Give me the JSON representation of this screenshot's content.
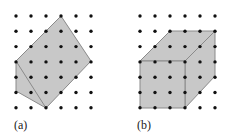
{
  "figure": {
    "panels": [
      {
        "id": "a",
        "label": "(a)",
        "grid": {
          "cols": 6,
          "rows": 7,
          "x0": 16,
          "y0": 16,
          "dx": 15,
          "dy": 15.3
        },
        "shape": "irregular pentagon polygon on dot lattice with internal diagonal edge",
        "polygon": [
          [
            61,
            16
          ],
          [
            91,
            61
          ],
          [
            46,
            108
          ],
          [
            16,
            91
          ],
          [
            16,
            61
          ]
        ],
        "inner_edge": [
          [
            16,
            61
          ],
          [
            46,
            108
          ]
        ]
      },
      {
        "id": "b",
        "label": "(b)",
        "grid": {
          "cols": 6,
          "rows": 7,
          "x0": 140,
          "y0": 16,
          "dx": 15,
          "dy": 15.3
        },
        "shape": "cube drawn on dot lattice",
        "front_face": [
          [
            140,
            61
          ],
          [
            185,
            61
          ],
          [
            185,
            108
          ],
          [
            140,
            108
          ]
        ],
        "top_face": [
          [
            140,
            61
          ],
          [
            170,
            31
          ],
          [
            215,
            31
          ],
          [
            185,
            61
          ]
        ],
        "side_face": [
          [
            185,
            61
          ],
          [
            215,
            31
          ],
          [
            215,
            76
          ],
          [
            185,
            108
          ]
        ]
      }
    ],
    "colors": {
      "fill": "#c8c8c8",
      "stroke": "#8a8a8a",
      "dot": "#111111"
    }
  }
}
